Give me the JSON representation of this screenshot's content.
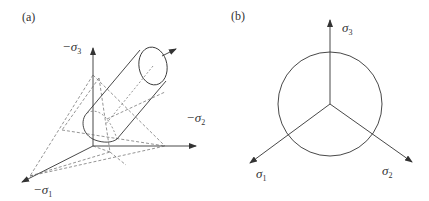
{
  "figure": {
    "panel_a": {
      "label": "(a)",
      "axes": {
        "sigma3": {
          "prefix": "−",
          "symbol": "σ",
          "sub": "3"
        },
        "sigma2": {
          "prefix": "−",
          "symbol": "σ",
          "sub": "2"
        },
        "sigma1": {
          "prefix": "−",
          "symbol": "σ",
          "sub": "1"
        }
      },
      "description": "3D principal stress space with yield cylinder along hydrostatic axis and dashed projection planes"
    },
    "panel_b": {
      "label": "(b)",
      "axes": {
        "sigma3": {
          "symbol": "σ",
          "sub": "3"
        },
        "sigma1": {
          "symbol": "σ",
          "sub": "1"
        },
        "sigma2": {
          "symbol": "σ",
          "sub": "2"
        }
      },
      "description": "Deviatoric (π) plane view: yield circle with three projected principal stress axes at 120°"
    },
    "colors": {
      "line": "#333333",
      "dashed": "#666666"
    }
  }
}
